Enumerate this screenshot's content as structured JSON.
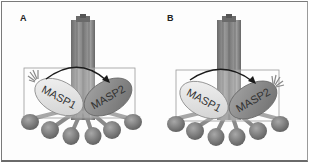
{
  "figure": {
    "panels": [
      {
        "id": "A",
        "label": "A",
        "left_protein": "MASP1",
        "right_protein": "MASP2",
        "arrow_direction": "MASP1 -> MASP2",
        "activation_burst_on": "MASP1"
      },
      {
        "id": "B",
        "label": "B",
        "left_protein": "MASP1",
        "right_protein": "MASP2",
        "arrow_direction": "MASP1 -> MASP2",
        "activation_burst_on": "MASP2"
      }
    ],
    "colors": {
      "stalk": "#8a8a8a",
      "stalk_dark": "#6f6f6f",
      "masp1_fill": "#e6e6e6",
      "masp2_fill": "#8c8c8c",
      "heads": "#7a7a7a",
      "box_stroke": "#9a9a9a",
      "arrow": "#1a1a1a",
      "frame": "#7a7a7a"
    }
  }
}
